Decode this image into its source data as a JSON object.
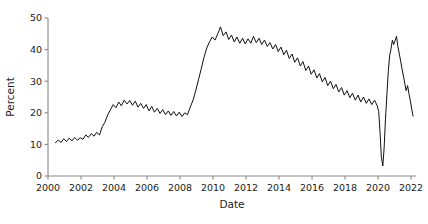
{
  "chart_data": {
    "type": "line",
    "title": "",
    "xlabel": "Date",
    "ylabel": "Percent",
    "xlim": [
      2000.0,
      2022.3
    ],
    "ylim": [
      0,
      50
    ],
    "grid": false,
    "legend": null,
    "xticks": [
      2000,
      2002,
      2004,
      2006,
      2008,
      2010,
      2012,
      2014,
      2016,
      2018,
      2020,
      2022
    ],
    "xtick_labels": [
      "2000",
      "2002",
      "2004",
      "2006",
      "2008",
      "2010",
      "2012",
      "2014",
      "2016",
      "2018",
      "2020",
      "2022"
    ],
    "yticks": [
      0,
      10,
      20,
      30,
      40,
      50
    ],
    "ytick_labels": [
      "0",
      "10",
      "20",
      "30",
      "40",
      "50"
    ],
    "line_color": "#101010",
    "line_width": 1.0,
    "series": [
      {
        "name": "Percent",
        "x": [
          2000.45,
          2000.62,
          2000.79,
          2000.95,
          2001.12,
          2001.29,
          2001.45,
          2001.62,
          2001.79,
          2001.95,
          2002.12,
          2002.29,
          2002.45,
          2002.62,
          2002.79,
          2002.95,
          2003.12,
          2003.29,
          2003.45,
          2003.62,
          2003.79,
          2003.95,
          2004.12,
          2004.29,
          2004.45,
          2004.62,
          2004.79,
          2004.95,
          2005.12,
          2005.29,
          2005.45,
          2005.62,
          2005.79,
          2005.95,
          2006.12,
          2006.29,
          2006.45,
          2006.62,
          2006.79,
          2006.95,
          2007.12,
          2007.29,
          2007.45,
          2007.62,
          2007.79,
          2007.95,
          2008.12,
          2008.29,
          2008.45,
          2008.62,
          2008.79,
          2008.95,
          2009.12,
          2009.29,
          2009.45,
          2009.62,
          2009.79,
          2009.95,
          2010.12,
          2010.29,
          2010.45,
          2010.62,
          2010.79,
          2010.95,
          2011.12,
          2011.29,
          2011.45,
          2011.62,
          2011.79,
          2011.95,
          2012.12,
          2012.29,
          2012.45,
          2012.62,
          2012.79,
          2012.95,
          2013.12,
          2013.29,
          2013.45,
          2013.62,
          2013.79,
          2013.95,
          2014.12,
          2014.29,
          2014.45,
          2014.62,
          2014.79,
          2014.95,
          2015.12,
          2015.29,
          2015.45,
          2015.62,
          2015.79,
          2015.95,
          2016.12,
          2016.29,
          2016.45,
          2016.62,
          2016.79,
          2016.95,
          2017.12,
          2017.29,
          2017.45,
          2017.62,
          2017.79,
          2017.95,
          2018.12,
          2018.29,
          2018.45,
          2018.62,
          2018.79,
          2018.95,
          2019.12,
          2019.29,
          2019.45,
          2019.62,
          2019.79,
          2019.95,
          2020.04,
          2020.12,
          2020.2,
          2020.29,
          2020.37,
          2020.45,
          2020.54,
          2020.62,
          2020.7,
          2020.79,
          2020.87,
          2020.95,
          2021.04,
          2021.12,
          2021.2,
          2021.29,
          2021.37,
          2021.45,
          2021.54,
          2021.62,
          2021.7,
          2021.79,
          2021.87,
          2021.95,
          2022.04,
          2022.12
        ],
        "y": [
          10.5,
          11.4,
          10.6,
          11.8,
          10.9,
          12.0,
          11.1,
          12.2,
          11.3,
          12.1,
          11.6,
          13.0,
          12.2,
          13.4,
          12.6,
          13.8,
          13.0,
          15.6,
          17.0,
          19.4,
          21.0,
          22.6,
          21.6,
          23.4,
          22.2,
          24.0,
          22.8,
          23.9,
          22.4,
          23.7,
          21.8,
          23.0,
          21.4,
          22.6,
          20.6,
          22.0,
          20.2,
          21.4,
          19.8,
          21.0,
          19.4,
          20.6,
          19.2,
          20.4,
          19.0,
          20.2,
          18.8,
          20.0,
          19.4,
          21.8,
          24.0,
          27.0,
          30.5,
          34.0,
          37.5,
          40.5,
          42.5,
          44.0,
          43.0,
          45.0,
          47.2,
          44.4,
          45.6,
          43.2,
          44.6,
          42.4,
          44.0,
          42.0,
          43.6,
          41.8,
          43.4,
          42.0,
          44.2,
          42.2,
          43.6,
          41.6,
          43.0,
          41.0,
          42.2,
          40.2,
          41.6,
          39.4,
          40.8,
          38.4,
          39.8,
          37.2,
          38.6,
          36.0,
          37.4,
          34.8,
          36.2,
          33.4,
          34.8,
          32.2,
          33.6,
          31.0,
          32.4,
          29.8,
          31.2,
          28.6,
          30.0,
          27.6,
          29.0,
          26.6,
          28.0,
          25.6,
          27.0,
          24.8,
          26.2,
          24.0,
          25.6,
          23.4,
          25.0,
          23.0,
          24.4,
          22.6,
          24.0,
          22.2,
          20.4,
          14.0,
          6.0,
          3.2,
          9.0,
          18.0,
          26.0,
          33.0,
          38.0,
          40.4,
          43.0,
          41.6,
          43.0,
          44.2,
          41.0,
          38.6,
          36.4,
          34.0,
          31.6,
          29.4,
          27.0,
          28.6,
          26.2,
          24.0,
          21.2,
          19.0
        ]
      }
    ]
  }
}
